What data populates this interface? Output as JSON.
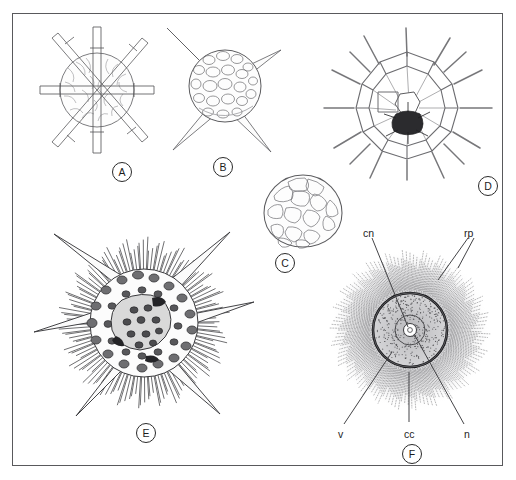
{
  "plate": {
    "title": "Radiolarian skeleton plate",
    "background_color": "#ffffff",
    "border_color": "#59595c",
    "ink_color": "#1d1d1d"
  },
  "figures": [
    {
      "id": "A",
      "label": "A",
      "caption_letter": "A",
      "description": "Spherical latticed radiolarian skeleton with six long radial spines arranged in three orthogonal axes",
      "label_x": 112,
      "label_y": 162,
      "body_x": 38,
      "body_y": 24,
      "body_w": 118,
      "body_h": 132
    },
    {
      "id": "B",
      "label": "B",
      "caption_letter": "B",
      "description": "Spherical pored shell with four tapering triangular spines",
      "label_x": 213,
      "label_y": 157,
      "body_x": 163,
      "body_y": 24,
      "body_w": 122,
      "body_h": 130
    },
    {
      "id": "C",
      "label": "C",
      "caption_letter": "C",
      "description": "Ovoid teardrop shell with irregular polygonal pores",
      "label_x": 275,
      "label_y": 253,
      "body_x": 258,
      "body_y": 172,
      "body_w": 90,
      "body_h": 78
    },
    {
      "id": "D",
      "label": "D",
      "caption_letter": "D",
      "description": "Open polygonal lattice sphere with radiating bars and dark central mass",
      "label_x": 478,
      "label_y": 176,
      "body_x": 316,
      "body_y": 22,
      "body_w": 182,
      "body_h": 160
    },
    {
      "id": "E",
      "label": "E",
      "caption_letter": "E",
      "description": "Dense porous sphere with six large conical spines and many fine bristles",
      "label_x": 136,
      "label_y": 423,
      "body_x": 30,
      "body_y": 228,
      "body_w": 228,
      "body_h": 190
    },
    {
      "id": "F",
      "label": "F",
      "caption_letter": "F",
      "description": "Living radiolarian cell showing central capsule, nucleus and radiating pseudopodia",
      "label_x": 402,
      "label_y": 444,
      "body_x": 326,
      "body_y": 244,
      "body_w": 168,
      "body_h": 172
    }
  ],
  "annotations": {
    "figure": "F",
    "items": [
      {
        "key": "cn",
        "label": "cn",
        "meaning": "central capsule nucleus",
        "text_x": 363,
        "text_y": 227,
        "leaders": [
          [
            372,
            238,
            408,
            327
          ]
        ]
      },
      {
        "key": "rp",
        "label": "rp",
        "meaning": "radiating pseudopodia",
        "text_x": 464,
        "text_y": 227,
        "leaders": [
          [
            468,
            238,
            438,
            280
          ],
          [
            474,
            238,
            458,
            268
          ]
        ]
      },
      {
        "key": "v",
        "label": "v",
        "meaning": "vacuoles",
        "text_x": 338,
        "text_y": 428,
        "leaders": [
          [
            344,
            424,
            392,
            352
          ]
        ]
      },
      {
        "key": "cc",
        "label": "cc",
        "meaning": "central capsule",
        "text_x": 404,
        "text_y": 428,
        "leaders": [
          [
            409,
            422,
            409,
            372
          ]
        ]
      },
      {
        "key": "n",
        "label": "n",
        "meaning": "nucleus",
        "text_x": 464,
        "text_y": 428,
        "leaders": [
          [
            464,
            424,
            414,
            334
          ]
        ]
      }
    ]
  }
}
